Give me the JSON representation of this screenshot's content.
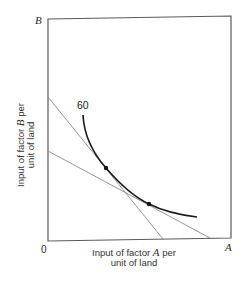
{
  "diagram": {
    "type": "isoquant-diagram",
    "axes": {
      "origin_label": "0",
      "x_end_label": "A",
      "y_end_label": "B",
      "x_title": {
        "line1_prefix": "Input of factor ",
        "line1_var": "A",
        "line1_suffix": " per",
        "line2": "unit of land"
      },
      "y_title": {
        "line1_prefix": "Input of factor ",
        "line1_var": "B",
        "line1_suffix": " per",
        "line2": "unit of land"
      }
    },
    "isoquant": {
      "label": "60",
      "color": "#1a1a1a"
    },
    "tangent_lines": [
      {
        "name": "steep-price-line",
        "color": "#8a8a8a"
      },
      {
        "name": "shallow-price-line",
        "color": "#8a8a8a"
      }
    ],
    "tangency_points": [
      {
        "name": "tangency-point-steep"
      },
      {
        "name": "tangency-point-shallow"
      }
    ],
    "frame_color": "#555555"
  }
}
